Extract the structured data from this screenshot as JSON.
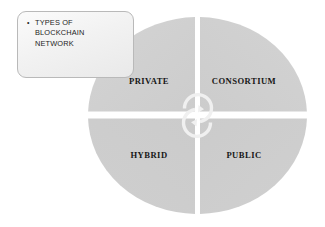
{
  "diagram": {
    "title_text": "TYPES OF\nBLOCKCHAIN\nNETWORK",
    "bullet_glyph": "•",
    "center_icon": "cycle-arrows-icon",
    "colors": {
      "quadrant_fill": "#c9c9c9",
      "quadrant_fill_light": "#d2d2d2",
      "background": "#ffffff",
      "divider": "#ffffff",
      "box_border": "#b9b9b9",
      "box_fill": "#f4f4f4",
      "label_text": "#161616"
    },
    "quadrants": [
      {
        "id": "private",
        "label": "PRIVATE",
        "position": "top-left"
      },
      {
        "id": "consortium",
        "label": "CONSORTIUM",
        "position": "top-right"
      },
      {
        "id": "hybrid",
        "label": "HYBRID",
        "position": "bottom-left"
      },
      {
        "id": "public",
        "label": "PUBLIC",
        "position": "bottom-right"
      }
    ]
  }
}
